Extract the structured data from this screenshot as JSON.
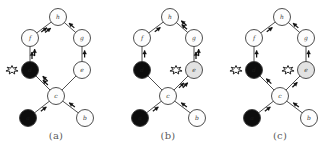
{
  "figure": {
    "node_fills": {
      "white": "#fdfdfd",
      "gray": "#e2e2e2",
      "black": "#0d0d0d"
    },
    "stroke_color": "#3a3a3a",
    "arrow_color": "#111111",
    "background": "#ffffff"
  },
  "panels": [
    {
      "caption": "(a)",
      "nodes": [
        {
          "id": "h",
          "label": "h",
          "fill": "white",
          "cx": 58,
          "cy": 17,
          "r": 8.5
        },
        {
          "id": "f",
          "label": "f",
          "fill": "white",
          "cx": 30,
          "cy": 38,
          "r": 8.5
        },
        {
          "id": "g",
          "label": "g",
          "fill": "white",
          "cx": 82,
          "cy": 38,
          "r": 8.5
        },
        {
          "id": "d",
          "label": "d",
          "fill": "black",
          "cx": 30,
          "cy": 70,
          "r": 8.5
        },
        {
          "id": "e",
          "label": "e",
          "fill": "white",
          "cx": 82,
          "cy": 70,
          "r": 8.5
        },
        {
          "id": "c",
          "label": "c",
          "fill": "white",
          "cx": 56,
          "cy": 96,
          "r": 8.5
        },
        {
          "id": "a",
          "label": "a",
          "fill": "black",
          "cx": 28,
          "cy": 118,
          "r": 8.5
        },
        {
          "id": "b",
          "label": "b",
          "fill": "white",
          "cx": 85,
          "cy": 118,
          "r": 8.5
        }
      ],
      "edges": [
        {
          "from": "f",
          "to": "h",
          "arrow": "double"
        },
        {
          "from": "g",
          "to": "h",
          "arrow": "single"
        },
        {
          "from": "d",
          "to": "f",
          "arrow": "double"
        },
        {
          "from": "e",
          "to": "g",
          "arrow": "single"
        },
        {
          "from": "e",
          "to": "c",
          "arrow": "none"
        },
        {
          "from": "c",
          "to": "d",
          "arrow": "double"
        },
        {
          "from": "a",
          "to": "c",
          "arrow": "single"
        },
        {
          "from": "b",
          "to": "c",
          "arrow": "single"
        }
      ],
      "bursts": [
        {
          "at": "d",
          "side": "left"
        }
      ]
    },
    {
      "caption": "(b)",
      "nodes": [
        {
          "id": "h",
          "label": "h",
          "fill": "white",
          "cx": 58,
          "cy": 17,
          "r": 8.5
        },
        {
          "id": "f",
          "label": "f",
          "fill": "white",
          "cx": 30,
          "cy": 38,
          "r": 8.5
        },
        {
          "id": "g",
          "label": "g",
          "fill": "white",
          "cx": 82,
          "cy": 38,
          "r": 8.5
        },
        {
          "id": "d",
          "label": "d",
          "fill": "black",
          "cx": 30,
          "cy": 70,
          "r": 8.5
        },
        {
          "id": "e",
          "label": "e",
          "fill": "gray",
          "cx": 82,
          "cy": 70,
          "r": 8.5
        },
        {
          "id": "c",
          "label": "c",
          "fill": "white",
          "cx": 56,
          "cy": 96,
          "r": 8.5
        },
        {
          "id": "a",
          "label": "a",
          "fill": "black",
          "cx": 28,
          "cy": 118,
          "r": 8.5
        },
        {
          "id": "b",
          "label": "b",
          "fill": "white",
          "cx": 85,
          "cy": 118,
          "r": 8.5
        }
      ],
      "edges": [
        {
          "from": "f",
          "to": "h",
          "arrow": "single"
        },
        {
          "from": "g",
          "to": "h",
          "arrow": "double"
        },
        {
          "from": "d",
          "to": "f",
          "arrow": "single"
        },
        {
          "from": "e",
          "to": "g",
          "arrow": "double"
        },
        {
          "from": "c",
          "to": "e",
          "arrow": "double"
        },
        {
          "from": "c",
          "to": "d",
          "arrow": "none"
        },
        {
          "from": "a",
          "to": "c",
          "arrow": "single"
        },
        {
          "from": "b",
          "to": "c",
          "arrow": "single"
        }
      ],
      "bursts": [
        {
          "at": "e",
          "side": "left"
        }
      ]
    },
    {
      "caption": "(c)",
      "nodes": [
        {
          "id": "h",
          "label": "h",
          "fill": "white",
          "cx": 58,
          "cy": 17,
          "r": 8.5
        },
        {
          "id": "f",
          "label": "f",
          "fill": "white",
          "cx": 30,
          "cy": 38,
          "r": 8.5
        },
        {
          "id": "g",
          "label": "g",
          "fill": "white",
          "cx": 82,
          "cy": 38,
          "r": 8.5
        },
        {
          "id": "d",
          "label": "d",
          "fill": "black",
          "cx": 30,
          "cy": 70,
          "r": 8.5
        },
        {
          "id": "e",
          "label": "e",
          "fill": "gray",
          "cx": 82,
          "cy": 70,
          "r": 8.5
        },
        {
          "id": "c",
          "label": "c",
          "fill": "white",
          "cx": 56,
          "cy": 96,
          "r": 8.5
        },
        {
          "id": "a",
          "label": "a",
          "fill": "black",
          "cx": 28,
          "cy": 118,
          "r": 8.5
        },
        {
          "id": "b",
          "label": "b",
          "fill": "white",
          "cx": 85,
          "cy": 118,
          "r": 8.5
        }
      ],
      "edges": [
        {
          "from": "f",
          "to": "h",
          "arrow": "single"
        },
        {
          "from": "g",
          "to": "h",
          "arrow": "single"
        },
        {
          "from": "d",
          "to": "f",
          "arrow": "single"
        },
        {
          "from": "e",
          "to": "g",
          "arrow": "single"
        },
        {
          "from": "c",
          "to": "e",
          "arrow": "single"
        },
        {
          "from": "c",
          "to": "d",
          "arrow": "single"
        },
        {
          "from": "a",
          "to": "c",
          "arrow": "single"
        },
        {
          "from": "b",
          "to": "c",
          "arrow": "single"
        }
      ],
      "bursts": [
        {
          "at": "d",
          "side": "left"
        },
        {
          "at": "e",
          "side": "left"
        }
      ]
    }
  ]
}
